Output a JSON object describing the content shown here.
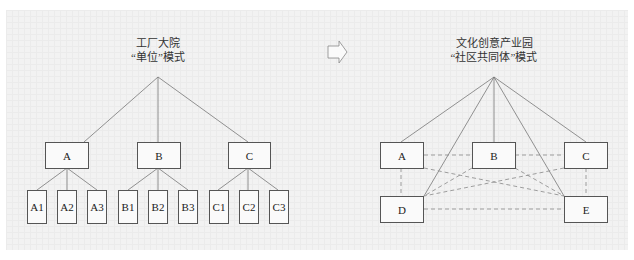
{
  "left": {
    "title_line1": "工厂大院",
    "title_line2": "“单位”模式",
    "parents": [
      {
        "label": "A",
        "children": [
          "A1",
          "A2",
          "A3"
        ]
      },
      {
        "label": "B",
        "children": [
          "B1",
          "B2",
          "B3"
        ]
      },
      {
        "label": "C",
        "children": [
          "C1",
          "C2",
          "C3"
        ]
      }
    ]
  },
  "arrow": {
    "icon": "right-arrow-outline-icon"
  },
  "right": {
    "title_line1": "文化创意产业园",
    "title_line2": "“社区共同体”模式",
    "nodes": [
      "A",
      "B",
      "C",
      "D",
      "E"
    ]
  },
  "colors": {
    "line": "#777777",
    "dashed": "#888888",
    "box_border": "#555555",
    "background": "#f2f2f2"
  }
}
